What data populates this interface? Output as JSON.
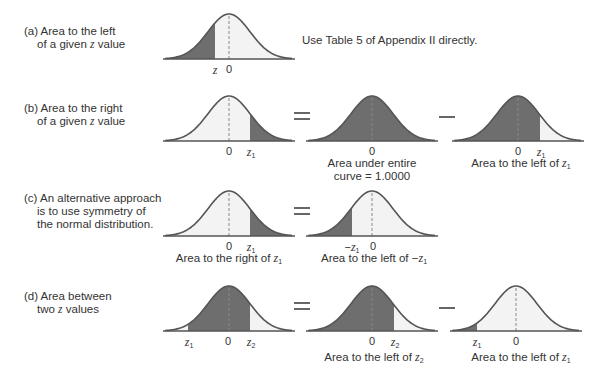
{
  "figure": {
    "colors": {
      "shaded": "#6e6e6e",
      "unshaded": "#f3f3f3",
      "curve_stroke": "#555555",
      "midline": "#888888",
      "operator": "#666666",
      "text": "#333333"
    },
    "rows": [
      {
        "id": "a",
        "label_line1": "(a) Area to the left",
        "label_line2_pre": "of a given ",
        "label_line2_var": "z",
        "label_line2_post": " value",
        "note": "Use Table 5 of Appendix II directly.",
        "panels": [
          {
            "ticks": [
              {
                "var": "z",
                "sub": ""
              },
              {
                "text": "0"
              }
            ],
            "shade": "left of z",
            "caption": ""
          }
        ]
      },
      {
        "id": "b",
        "label_line1": "(b) Area to the right",
        "label_line2_pre": "of a given ",
        "label_line2_var": "z",
        "label_line2_post": " value",
        "operators": [
          "=",
          "−"
        ],
        "panels": [
          {
            "ticks": [
              {
                "text": "0"
              },
              {
                "var": "z",
                "sub": "1"
              }
            ],
            "shade": "right of z1",
            "caption": ""
          },
          {
            "ticks": [
              {
                "text": "0"
              }
            ],
            "shade": "entire curve",
            "caption_line1": "Area under entire",
            "caption_line2": "curve = 1.0000"
          },
          {
            "ticks": [
              {
                "text": "0"
              },
              {
                "var": "z",
                "sub": "1"
              }
            ],
            "shade": "left of z1",
            "caption_pre": "Area to the left of ",
            "caption_var": "z",
            "caption_sub": "1"
          }
        ]
      },
      {
        "id": "c",
        "label_line1": "(c) An alternative approach",
        "label_line2": "is to use symmetry of",
        "label_line3": "the normal distribution.",
        "operators": [
          "="
        ],
        "panels": [
          {
            "ticks": [
              {
                "text": "0"
              },
              {
                "var": "z",
                "sub": "1"
              }
            ],
            "shade": "right of z1",
            "caption_pre": "Area to the right of ",
            "caption_var": "z",
            "caption_sub": "1"
          },
          {
            "ticks": [
              {
                "prefix": "−",
                "var": "z",
                "sub": "1"
              },
              {
                "text": "0"
              }
            ],
            "shade": "left of -z1",
            "caption_pre": "Area to the left of −",
            "caption_var": "z",
            "caption_sub": "1"
          }
        ]
      },
      {
        "id": "d",
        "label_line1": "(d) Area between",
        "label_line2_pre": "two ",
        "label_line2_var": "z",
        "label_line2_post": " values",
        "operators": [
          "=",
          "−"
        ],
        "panels": [
          {
            "ticks": [
              {
                "var": "z",
                "sub": "1"
              },
              {
                "text": "0"
              },
              {
                "var": "z",
                "sub": "2"
              }
            ],
            "shade": "between z1 and z2",
            "caption": ""
          },
          {
            "ticks": [
              {
                "text": "0"
              },
              {
                "var": "z",
                "sub": "2"
              }
            ],
            "shade": "left of z2",
            "caption_pre": "Area to the left of ",
            "caption_var": "z",
            "caption_sub": "2"
          },
          {
            "ticks": [
              {
                "var": "z",
                "sub": "1"
              },
              {
                "text": "0"
              }
            ],
            "shade": "left of z1",
            "caption_pre": "Area to the left of ",
            "caption_var": "z",
            "caption_sub": "1"
          }
        ]
      }
    ]
  }
}
